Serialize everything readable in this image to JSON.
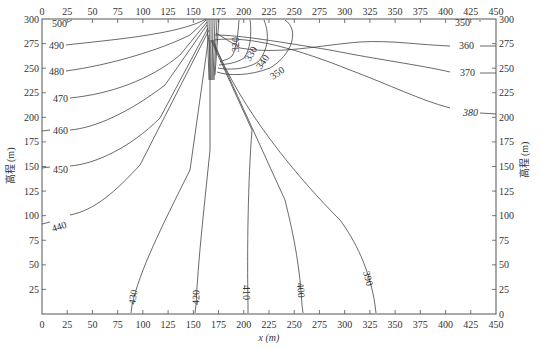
{
  "chart_data": {
    "type": "contour",
    "title": "",
    "xlabel": "x (m)",
    "ylabel": "高程 (m)",
    "ylabel_right": "高程 (m)",
    "xlim": [
      0,
      450
    ],
    "ylim": [
      0,
      300
    ],
    "x_ticks": [
      0,
      25,
      50,
      75,
      100,
      125,
      150,
      175,
      200,
      225,
      250,
      275,
      300,
      325,
      350,
      375,
      400,
      425,
      450
    ],
    "y_ticks": [
      0,
      25,
      50,
      75,
      100,
      125,
      150,
      175,
      200,
      225,
      250,
      275,
      300
    ],
    "x_tick_labels_bottom": [
      "0",
      "25",
      "50",
      "75",
      "100",
      "125",
      "150",
      "175",
      "200",
      "225",
      "250",
      "275",
      "300",
      "325",
      "350",
      "375",
      "400",
      "425",
      "450"
    ],
    "x_tick_labels_top": [
      "0",
      "25",
      "50",
      "75",
      "100",
      "125",
      "150",
      "175",
      "200",
      "225",
      "250",
      "275",
      "300",
      "325",
      "350",
      "375",
      "400",
      "425",
      "450"
    ],
    "y_tick_labels_left": [
      "300",
      "275",
      "250",
      "225",
      "200",
      "175",
      "150",
      "125",
      "100",
      "75",
      "50",
      "25"
    ],
    "y_tick_labels_right": [
      "300",
      "275",
      "250",
      "225",
      "200",
      "175",
      "150",
      "125",
      "100",
      "75",
      "50",
      "25",
      "0"
    ],
    "grid": false,
    "legend": null,
    "contour_levels": [
      320,
      330,
      340,
      350,
      360,
      370,
      380,
      390,
      400,
      410,
      420,
      430,
      440,
      450,
      460,
      470,
      480,
      490,
      500
    ],
    "contour_labels": [
      {
        "level": "500",
        "x": 8,
        "y": 296
      },
      {
        "level": "490",
        "x": 10,
        "y": 274
      },
      {
        "level": "480",
        "x": 10,
        "y": 250
      },
      {
        "level": "470",
        "x": 10,
        "y": 224
      },
      {
        "level": "460",
        "x": 10,
        "y": 186
      },
      {
        "level": "450",
        "x": 10,
        "y": 147
      },
      {
        "level": "440",
        "x": 10,
        "y": 88
      },
      {
        "level": "430",
        "x": 90,
        "y": 14
      },
      {
        "level": "420",
        "x": 160,
        "y": 14
      },
      {
        "level": "410",
        "x": 208,
        "y": 14
      },
      {
        "level": "400",
        "x": 262,
        "y": 18
      },
      {
        "level": "390",
        "x": 330,
        "y": 28
      },
      {
        "level": "380",
        "x": 420,
        "y": 104
      },
      {
        "level": "370",
        "x": 420,
        "y": 180
      },
      {
        "level": "360",
        "x": 420,
        "y": 242
      },
      {
        "level": "350",
        "x": 420,
        "y": 296
      },
      {
        "level": "350",
        "x": 265,
        "y": 258
      },
      {
        "level": "340",
        "x": 255,
        "y": 266
      },
      {
        "level": "330",
        "x": 245,
        "y": 271
      },
      {
        "level": "320",
        "x": 235,
        "y": 282
      }
    ],
    "annotations": []
  },
  "axes": {
    "xlabel": "x (m)",
    "ylabel_left": "高程 (m)",
    "ylabel_right": "高程 (m)"
  }
}
